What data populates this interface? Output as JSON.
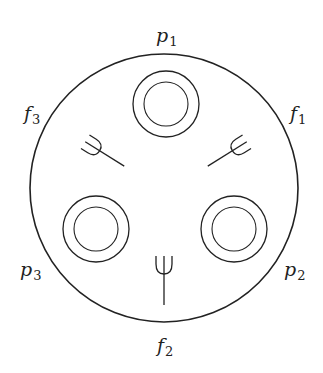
{
  "diagram": {
    "table": {
      "cx": 164,
      "cy": 188,
      "r": 134
    },
    "plates": [
      {
        "id": "p1",
        "cx": 166,
        "cy": 104,
        "r_outer": 33,
        "r_inner": 22
      },
      {
        "id": "p2",
        "cx": 234,
        "cy": 229,
        "r_outer": 33,
        "r_inner": 22
      },
      {
        "id": "p3",
        "cx": 96,
        "cy": 229,
        "r_outer": 33,
        "r_inner": 22
      }
    ],
    "labels": [
      {
        "id": "p1",
        "base": "p",
        "sub": "1",
        "x": 156,
        "y": 42
      },
      {
        "id": "f1",
        "base": "f",
        "sub": "1",
        "x": 290,
        "y": 120
      },
      {
        "id": "p2",
        "base": "p",
        "sub": "2",
        "x": 284,
        "y": 276
      },
      {
        "id": "f2",
        "base": "f",
        "sub": "2",
        "x": 157,
        "y": 352
      },
      {
        "id": "p3",
        "base": "p",
        "sub": "3",
        "x": 20,
        "y": 276
      },
      {
        "id": "f3",
        "base": "f",
        "sub": "3",
        "x": 24,
        "y": 120
      }
    ],
    "stroke_color": "#222222"
  }
}
